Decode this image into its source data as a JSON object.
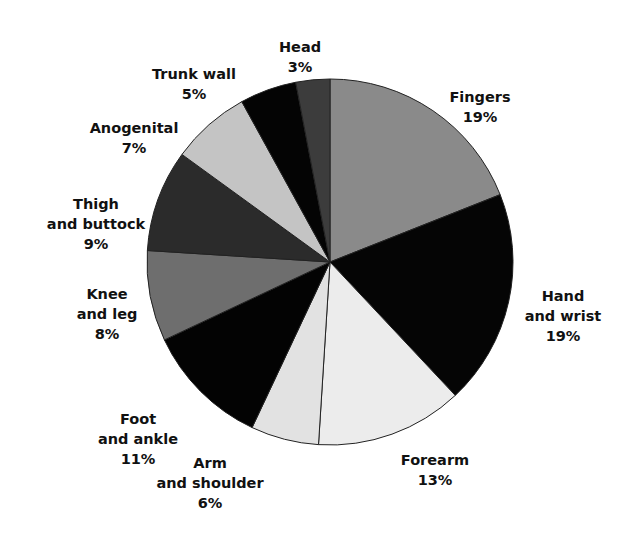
{
  "chart_data": {
    "type": "pie",
    "title": "",
    "start_angle_deg": 0,
    "direction": "clockwise",
    "slices": [
      {
        "label": "Fingers",
        "value": 19,
        "display": "19%",
        "color": "#8a8a8a",
        "label_lines": [
          "Fingers",
          "19%"
        ]
      },
      {
        "label": "Hand and wrist",
        "value": 19,
        "display": "19%",
        "color": "#050505",
        "label_lines": [
          "Hand",
          "and wrist",
          "19%"
        ]
      },
      {
        "label": "Forearm",
        "value": 13,
        "display": "13%",
        "color": "#ececec",
        "label_lines": [
          "Forearm",
          "13%"
        ]
      },
      {
        "label": "Arm and shoulder",
        "value": 6,
        "display": "6%",
        "color": "#e2e2e2",
        "label_lines": [
          "Arm",
          "and shoulder",
          "6%"
        ]
      },
      {
        "label": "Foot and ankle",
        "value": 11,
        "display": "11%",
        "color": "#030303",
        "label_lines": [
          "Foot",
          "and ankle",
          "11%"
        ]
      },
      {
        "label": "Knee and leg",
        "value": 8,
        "display": "8%",
        "color": "#6e6e6e",
        "label_lines": [
          "Knee",
          "and leg",
          "8%"
        ]
      },
      {
        "label": "Thigh and buttock",
        "value": 9,
        "display": "9%",
        "color": "#2b2b2b",
        "label_lines": [
          "Thigh",
          "and buttock",
          "9%"
        ]
      },
      {
        "label": "Anogenital",
        "value": 7,
        "display": "7%",
        "color": "#c4c4c4",
        "label_lines": [
          "Anogenital",
          "7%"
        ]
      },
      {
        "label": "Trunk wall",
        "value": 5,
        "display": "5%",
        "color": "#040404",
        "label_lines": [
          "Trunk wall",
          "5%"
        ]
      },
      {
        "label": "Head",
        "value": 3,
        "display": "3%",
        "color": "#3c3c3c",
        "label_lines": [
          "Head",
          "3%"
        ]
      }
    ],
    "legend": "none (labels placed around pie)"
  },
  "labels": [
    {
      "x": 480,
      "y": 87
    },
    {
      "x": 563,
      "y": 286
    },
    {
      "x": 435,
      "y": 450
    },
    {
      "x": 210,
      "y": 453
    },
    {
      "x": 138,
      "y": 409
    },
    {
      "x": 107,
      "y": 284
    },
    {
      "x": 96,
      "y": 194
    },
    {
      "x": 134,
      "y": 118
    },
    {
      "x": 194,
      "y": 64
    },
    {
      "x": 300,
      "y": 37
    }
  ]
}
